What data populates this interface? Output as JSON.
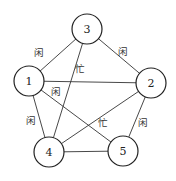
{
  "diagram": {
    "type": "graph",
    "nodes": [
      {
        "id": "1",
        "label": "1",
        "x": 29,
        "y": 81
      },
      {
        "id": "2",
        "label": "2",
        "x": 151,
        "y": 83
      },
      {
        "id": "3",
        "label": "3",
        "x": 87,
        "y": 29
      },
      {
        "id": "4",
        "label": "4",
        "x": 49,
        "y": 152
      },
      {
        "id": "5",
        "label": "5",
        "x": 123,
        "y": 151
      }
    ],
    "edges": [
      {
        "from": "1",
        "to": "3",
        "label": "闲",
        "lx": 39,
        "ly": 53
      },
      {
        "from": "3",
        "to": "2",
        "label": "闲",
        "lx": 123,
        "ly": 52
      },
      {
        "from": "1",
        "to": "2",
        "label": ""
      },
      {
        "from": "3",
        "to": "4",
        "label": "忙",
        "lx": 80,
        "ly": 69
      },
      {
        "from": "1",
        "to": "5",
        "label": "闲",
        "lx": 56,
        "ly": 92
      },
      {
        "from": "1",
        "to": "4",
        "label": "闲",
        "lx": 31,
        "ly": 121
      },
      {
        "from": "2",
        "to": "4",
        "label": "忙",
        "lx": 103,
        "ly": 123
      },
      {
        "from": "2",
        "to": "5",
        "label": "闲",
        "lx": 143,
        "ly": 123
      },
      {
        "from": "4",
        "to": "5",
        "label": ""
      }
    ]
  }
}
